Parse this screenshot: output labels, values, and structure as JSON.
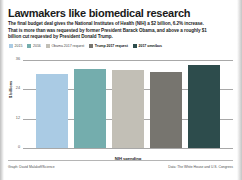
{
  "header": {
    "title": "Lawmakers like biomedical research",
    "subtitle": "The final budget deal gives the National Institutes of Health (NIH) a $2 billion, 6.2% increase. That is more than was requested by former President Barack Obama, and above a roughly $1 billion cut requested by President Donald Trump."
  },
  "footer": {
    "credit": "Graph: David Malakoff/Science",
    "source": "Data: The White House and U.S. Congress"
  },
  "chart_data": {
    "type": "bar",
    "title": "Lawmakers like biomedical research",
    "xlabel": "NIH spending",
    "ylabel": "$ billions",
    "categories": [
      "2015",
      "2016",
      "Obama 2017 request",
      "Trump 2017 request",
      "2017 omnibus"
    ],
    "values": [
      30.3,
      32.3,
      32.0,
      31.3,
      34.1
    ],
    "ylim": [
      0,
      36
    ],
    "yticks": [
      "36",
      "24",
      "12",
      "0"
    ],
    "ytick_values": [
      36,
      24,
      12,
      0
    ],
    "grid": true,
    "legend_position": "top",
    "colors": [
      "#aacbe4",
      "#74adad",
      "#c2bfb6",
      "#77756f",
      "#2d4c4c"
    ],
    "series": [
      {
        "name": "2015",
        "value": 30.3,
        "color": "#aacbe4",
        "emphasis": false
      },
      {
        "name": "2016",
        "value": 32.3,
        "color": "#74adad",
        "emphasis": false
      },
      {
        "name": "Obama 2017 request",
        "value": 32.0,
        "color": "#c2bfb6",
        "emphasis": false
      },
      {
        "name": "Trump 2017 request",
        "value": 31.3,
        "color": "#77756f",
        "emphasis": true
      },
      {
        "name": "2017 omnibus",
        "value": 34.1,
        "color": "#2d4c4c",
        "emphasis": true
      }
    ]
  }
}
